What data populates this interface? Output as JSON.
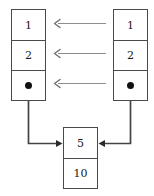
{
  "diagram": {
    "colors": {
      "box_border": "#4a4a4a",
      "text": "#1a1a1a",
      "pointer_line": "#444444",
      "reference_arrow": "#8d8d8d",
      "dot": "#111111",
      "background": "#ffffff"
    },
    "nodes": {
      "left_list": {
        "label": "left-list",
        "cells": [
          {
            "id": "left-cell-1",
            "value": "1",
            "kind": "value"
          },
          {
            "id": "left-cell-2",
            "value": "2",
            "kind": "value"
          },
          {
            "id": "left-cell-3",
            "value": "",
            "kind": "pointer"
          }
        ]
      },
      "right_list": {
        "label": "right-list",
        "cells": [
          {
            "id": "right-cell-1",
            "value": "1",
            "kind": "value"
          },
          {
            "id": "right-cell-2",
            "value": "2",
            "kind": "value"
          },
          {
            "id": "right-cell-3",
            "value": "",
            "kind": "pointer"
          }
        ]
      },
      "shared_tail": {
        "label": "shared-tail",
        "cells": [
          {
            "id": "shared-cell-1",
            "value": "5",
            "kind": "value"
          },
          {
            "id": "shared-cell-2",
            "value": "10",
            "kind": "value"
          }
        ]
      }
    },
    "arrows": {
      "reference_arrows": [
        {
          "id": "ref-arrow-row-1",
          "direction": "left",
          "from_row": "right-cell-1",
          "to_row": "left-cell-1"
        },
        {
          "id": "ref-arrow-row-2",
          "direction": "left",
          "from_row": "right-cell-2",
          "to_row": "left-cell-2"
        },
        {
          "id": "ref-arrow-row-3",
          "direction": "left",
          "from_row": "right-cell-3",
          "to_row": "left-cell-3"
        }
      ],
      "pointer_arrows": [
        {
          "id": "left-pointer-arrow",
          "from": "left-cell-3",
          "to": "shared-cell-1",
          "direction": "right"
        },
        {
          "id": "right-pointer-arrow",
          "from": "right-cell-3",
          "to": "shared-cell-1",
          "direction": "left"
        }
      ]
    }
  }
}
